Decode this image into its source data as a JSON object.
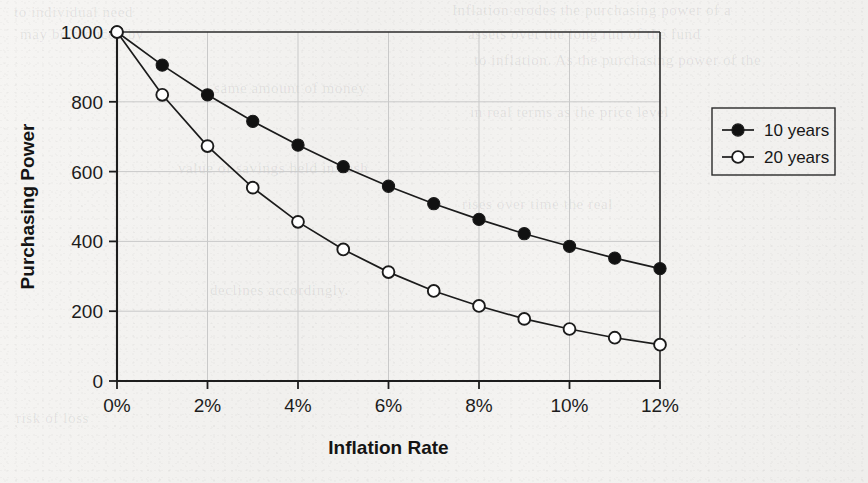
{
  "chart_data": {
    "type": "line",
    "title": "",
    "xlabel": "Inflation Rate",
    "ylabel": "Purchasing Power",
    "x": [
      0,
      1,
      2,
      3,
      4,
      5,
      6,
      7,
      8,
      9,
      10,
      11,
      12
    ],
    "x_tick_labels": [
      "0%",
      "2%",
      "4%",
      "6%",
      "8%",
      "10%",
      "12%"
    ],
    "x_tick_values": [
      0,
      2,
      4,
      6,
      8,
      10,
      12
    ],
    "y_tick_labels": [
      "0",
      "200",
      "400",
      "600",
      "800",
      "1000"
    ],
    "y_tick_values": [
      0,
      200,
      400,
      600,
      800,
      1000
    ],
    "xlim": [
      0,
      12
    ],
    "ylim": [
      0,
      1000
    ],
    "grid": true,
    "legend_position": "right-outside",
    "series": [
      {
        "name": "10 years",
        "marker": "filled-circle",
        "values": [
          1000,
          905,
          820,
          744,
          676,
          614,
          558,
          508,
          463,
          422,
          386,
          352,
          322
        ]
      },
      {
        "name": "20 years",
        "marker": "open-circle",
        "values": [
          1000,
          820,
          673,
          554,
          456,
          377,
          312,
          258,
          215,
          178,
          149,
          124,
          104
        ]
      }
    ]
  },
  "legend": {
    "entries": [
      {
        "label": "10 years"
      },
      {
        "label": "20 years"
      }
    ]
  },
  "background_text": [
    "to individual need",
    "may be reduced by",
    "Inflation erodes the purchasing power of a",
    "assets over the long run of the fund",
    "to inflation. As the purchasing power of the",
    "same amount of money",
    "in real terms as the price level",
    "value of savings held in cash",
    "rises over time the real",
    "declines accordingly.",
    "risk of loss"
  ],
  "colors": {
    "ink": "#1c1c1c",
    "frame": "#2a2a2a",
    "grid": "#c9c9c9",
    "paper": "#f4f3f1",
    "marker_fill": "#111111",
    "marker_open": "#ffffff"
  }
}
